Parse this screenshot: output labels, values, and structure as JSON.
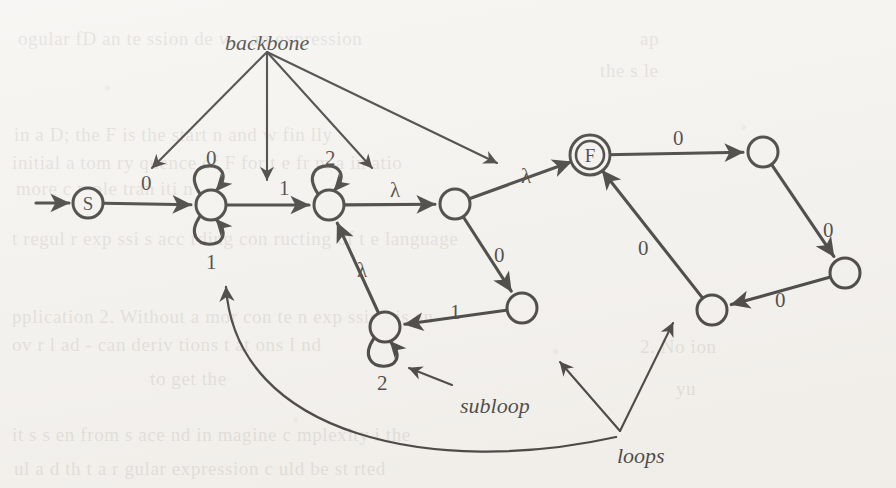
{
  "figure": {
    "kind": "state-machine-diagram",
    "ink_color": "#171512",
    "paper_color": "#f4f2ee"
  },
  "nodes": [
    {
      "id": "start",
      "label": "S",
      "double": false,
      "cx": 88,
      "cy": 203,
      "r": 15
    },
    {
      "id": "n1",
      "label": "",
      "double": false,
      "cx": 211,
      "cy": 205,
      "r": 15
    },
    {
      "id": "n2",
      "label": "",
      "double": false,
      "cx": 329,
      "cy": 205,
      "r": 15
    },
    {
      "id": "n3",
      "label": "",
      "double": false,
      "cx": 455,
      "cy": 204,
      "r": 15
    },
    {
      "id": "final",
      "label": "F",
      "double": true,
      "cx": 590,
      "cy": 155,
      "r": 15
    },
    {
      "id": "n4",
      "label": "",
      "double": false,
      "cx": 522,
      "cy": 308,
      "r": 15
    },
    {
      "id": "n5",
      "label": "",
      "double": false,
      "cx": 385,
      "cy": 327,
      "r": 15
    },
    {
      "id": "n6",
      "label": "",
      "double": false,
      "cx": 712,
      "cy": 310,
      "r": 15
    },
    {
      "id": "n7",
      "label": "",
      "double": false,
      "cx": 763,
      "cy": 152,
      "r": 15
    },
    {
      "id": "n8",
      "label": "",
      "double": false,
      "cx": 845,
      "cy": 273,
      "r": 15
    }
  ],
  "edges": [
    {
      "from": "entry",
      "to": "start",
      "label": "",
      "label_x": 0,
      "label_y": 0
    },
    {
      "from": "start",
      "to": "n1",
      "label": "0",
      "label_x": 141,
      "label_y": 171
    },
    {
      "from": "n1",
      "to": "n2",
      "label": "1",
      "label_x": 279,
      "label_y": 176
    },
    {
      "from": "n2",
      "to": "n3",
      "label": "λ",
      "label_x": 390,
      "label_y": 178
    },
    {
      "from": "n3",
      "to": "final",
      "label": "λ",
      "label_x": 521,
      "label_y": 164
    },
    {
      "from": "n3",
      "to": "n4",
      "label": "0",
      "label_x": 494,
      "label_y": 243
    },
    {
      "from": "n4",
      "to": "n5",
      "label": "1",
      "label_x": 450,
      "label_y": 300
    },
    {
      "from": "n5",
      "to": "n2",
      "label": "λ",
      "label_x": 357,
      "label_y": 258
    },
    {
      "from": "n6",
      "to": "final",
      "label": "0",
      "label_x": 638,
      "label_y": 236
    },
    {
      "from": "final",
      "to": "n7",
      "label": "0",
      "label_x": 673,
      "label_y": 126
    },
    {
      "from": "n7",
      "to": "n8",
      "label": "0",
      "label_x": 823,
      "label_y": 218
    },
    {
      "from": "n8",
      "to": "n6",
      "label": "0",
      "label_x": 775,
      "label_y": 288
    }
  ],
  "self_loops": [
    {
      "node": "n1",
      "label": "0",
      "position": "above",
      "label_x": 206,
      "label_y": 146
    },
    {
      "node": "n1",
      "label": "1",
      "position": "below",
      "label_x": 206,
      "label_y": 250
    },
    {
      "node": "n2",
      "label": "2",
      "position": "above",
      "label_x": 325,
      "label_y": 146
    },
    {
      "node": "n5",
      "label": "2",
      "position": "below",
      "label_x": 377,
      "label_y": 371
    }
  ],
  "callouts": [
    {
      "id": "backbone",
      "text": "backbone",
      "label_x": 265,
      "label_y": 30,
      "origin_x": 267,
      "origin_y": 52,
      "targets": [
        {
          "x": 152,
          "y": 168
        },
        {
          "x": 267,
          "y": 180
        },
        {
          "x": 372,
          "y": 168
        },
        {
          "x": 497,
          "y": 163
        }
      ]
    },
    {
      "id": "subloop",
      "text": "subloop",
      "label_x": 460,
      "label_y": 393,
      "origin_x": 452,
      "origin_y": 385,
      "targets": [
        {
          "x": 409,
          "y": 368
        }
      ]
    },
    {
      "id": "loops",
      "text": "loops",
      "label_x": 617,
      "label_y": 443,
      "origin_x": 620,
      "origin_y": 431,
      "targets": [
        {
          "x": 560,
          "y": 362
        },
        {
          "x": 673,
          "y": 323
        }
      ]
    }
  ],
  "long_curve": {
    "id": "loops-to-backbone-loop",
    "from_x": 616,
    "from_y": 437,
    "to_x": 226,
    "to_y": 287
  },
  "ghost_text": [
    {
      "text": "ogular  fD    an    te   ssion  de  w  -   an  expression",
      "x": 18,
      "y": 28
    },
    {
      "text": "in a  D; the  F  is   the  start      n    and   w    fin lly",
      "x": 14,
      "y": 124
    },
    {
      "text": "initial a tom ry  quence  of  F  for    t  e   fr m   a  in  atio",
      "x": 12,
      "y": 152
    },
    {
      "text": "more   c   mple   tran  iti  n",
      "x": 16,
      "y": 178
    },
    {
      "text": "t    regul  r  exp  ssi  s  acc  rding  con  ructing  of t  e  language",
      "x": 12,
      "y": 228
    },
    {
      "text": "pplication 2.  Without    a   mor   con    te      n   exp   ssion  is  an",
      "x": 12,
      "y": 306
    },
    {
      "text": "ov  r  l   ad  -   can    deriv   tions  t  at  ons  I   nd",
      "x": 12,
      "y": 334
    },
    {
      "text": "to     get     the",
      "x": 150,
      "y": 368
    },
    {
      "text": "it  s  s  en  from     s  ace    nd      in    magine    c  mplexity    i  the",
      "x": 12,
      "y": 424
    },
    {
      "text": "ul   a   d  th  t   a  r  gular    expression   c  uld    be    st   rted",
      "x": 14,
      "y": 458
    },
    {
      "text": "ap",
      "x": 640,
      "y": 28
    },
    {
      "text": "the   s   le",
      "x": 600,
      "y": 60
    },
    {
      "text": "mum",
      "x": 570,
      "y": 150
    },
    {
      "text": "2.   No  ion",
      "x": 640,
      "y": 336
    },
    {
      "text": "yu",
      "x": 676,
      "y": 378
    }
  ]
}
